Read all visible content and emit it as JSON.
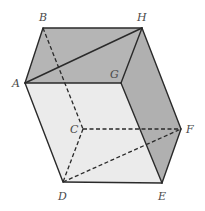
{
  "figure": {
    "type": "parallelepiped",
    "vertices": {
      "A": {
        "x": 25,
        "y": 83
      },
      "B": {
        "x": 43,
        "y": 28
      },
      "H": {
        "x": 142,
        "y": 28
      },
      "G": {
        "x": 121,
        "y": 83
      },
      "C": {
        "x": 83,
        "y": 129
      },
      "F": {
        "x": 181,
        "y": 129
      },
      "D": {
        "x": 63,
        "y": 182
      },
      "E": {
        "x": 162,
        "y": 183
      }
    },
    "labels": {
      "A": "A",
      "B": "B",
      "C": "C",
      "D": "D",
      "E": "E",
      "F": "F",
      "G": "G",
      "H": "H"
    },
    "faces": {
      "top": {
        "vertices": [
          "A",
          "B",
          "H",
          "G"
        ],
        "color": "#b5b5b5"
      },
      "right": {
        "vertices": [
          "G",
          "H",
          "F",
          "E"
        ],
        "color": "#b0b0b0"
      },
      "front": {
        "vertices": [
          "A",
          "G",
          "E",
          "D"
        ],
        "color": "#ebebeb"
      }
    },
    "solid_edges": [
      [
        "A",
        "B"
      ],
      [
        "B",
        "H"
      ],
      [
        "A",
        "H"
      ],
      [
        "A",
        "G"
      ],
      [
        "G",
        "H"
      ],
      [
        "H",
        "F"
      ],
      [
        "F",
        "E"
      ],
      [
        "E",
        "D"
      ],
      [
        "D",
        "A"
      ],
      [
        "G",
        "E"
      ]
    ],
    "dashed_edges": [
      [
        "B",
        "C"
      ],
      [
        "C",
        "F"
      ],
      [
        "C",
        "D"
      ],
      [
        "D",
        "F"
      ]
    ]
  }
}
